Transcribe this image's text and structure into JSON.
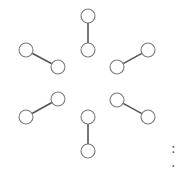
{
  "diagram": {
    "type": "graph",
    "node_radius": 7,
    "colors": {
      "node_stroke": "#7a7a7a",
      "edge": "#555555",
      "background": "#ffffff"
    },
    "pairs": [
      {
        "id": "top",
        "a": [
          88,
          16
        ],
        "b": [
          88,
          50
        ]
      },
      {
        "id": "upper-left",
        "a": [
          26,
          50
        ],
        "b": [
          58,
          67
        ]
      },
      {
        "id": "upper-right",
        "a": [
          117,
          67
        ],
        "b": [
          148,
          50
        ]
      },
      {
        "id": "lower-left",
        "a": [
          26,
          117
        ],
        "b": [
          58,
          99
        ]
      },
      {
        "id": "lower-right",
        "a": [
          117,
          100
        ],
        "b": [
          148,
          117
        ]
      },
      {
        "id": "bottom",
        "a": [
          88,
          117
        ],
        "b": [
          88,
          151
        ]
      }
    ]
  },
  "caption": {
    "text": ": ."
  }
}
